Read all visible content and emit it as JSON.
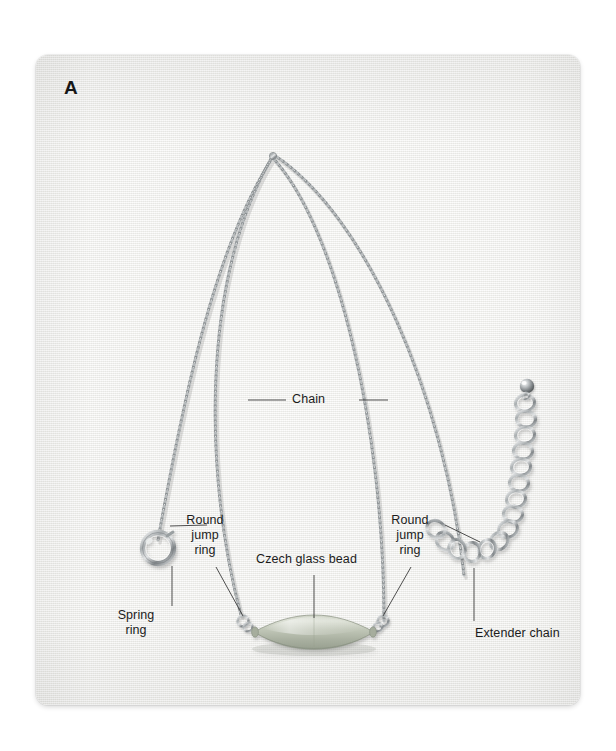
{
  "figure": {
    "panel_letter": "A",
    "background_color": "#f1f1ef",
    "panel_border_radius": "12px"
  },
  "callouts": [
    {
      "id": "chain",
      "label": "Chain",
      "leader": "both-sides-horizontal",
      "target": "main cable chain"
    },
    {
      "id": "round-jump-ring-left",
      "label": "Round\njump\nring",
      "leader": "up-left-and-down-right",
      "target": "left jump ring at bead"
    },
    {
      "id": "czech-glass-bead",
      "label": "Czech glass bead",
      "leader": "vertical-down",
      "target": "focal glass bead"
    },
    {
      "id": "round-jump-ring-right",
      "label": "Round\njump\nring",
      "leader": "up-right-and-down-left",
      "target": "right jump ring at bead"
    },
    {
      "id": "spring-ring",
      "label": "Spring\nring",
      "leader": "vertical-up",
      "target": "spring ring clasp"
    },
    {
      "id": "extender-chain",
      "label": "Extender chain",
      "leader": "vertical-up",
      "target": "large-link extender chain"
    }
  ],
  "components": {
    "chain_color": "#a9acad",
    "bead_color": "#b9bfb1",
    "bead_highlight": "#d3d8cc",
    "bead_shadow": "#8e9589",
    "metal_light": "#e4e6e7",
    "metal_mid": "#a8acae",
    "metal_dark": "#6f7476",
    "leader_line_color": "#3a3a3a",
    "bead_shape": "flattened lozenge / oval tube",
    "extender_end_ball": "small silver ball",
    "extender_link_count": 14
  }
}
